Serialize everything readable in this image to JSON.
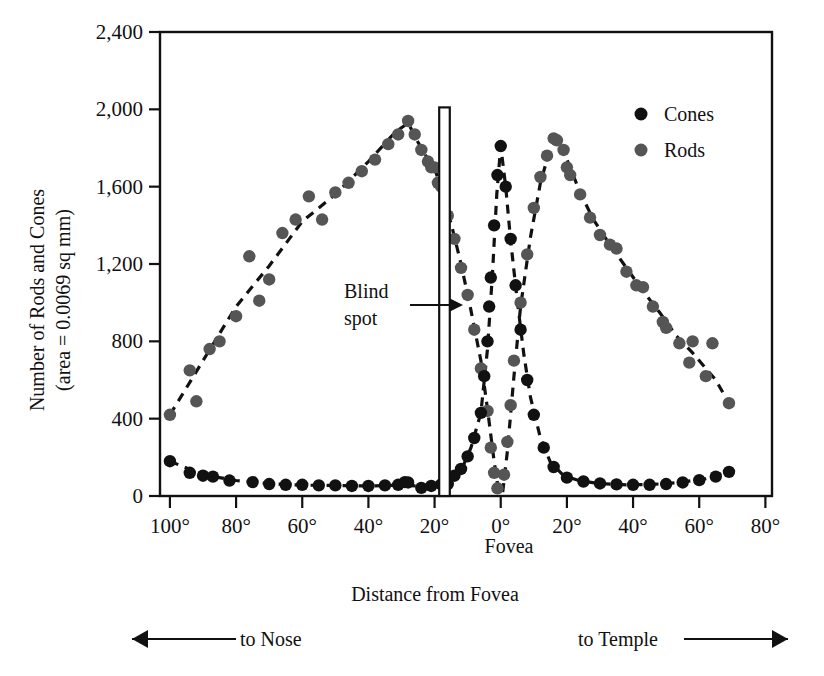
{
  "chart_data": {
    "type": "scatter",
    "title": "",
    "xlabel": "Distance from Fovea",
    "ylabel": "Number of Rods and Cones (area = 0.0069 sq mm)",
    "ylabel_line1": "Number of Rods and Cones",
    "ylabel_line2": "(area = 0.0069 sq mm)",
    "xlim": [
      -103,
      82
    ],
    "ylim": [
      0,
      2400
    ],
    "grid": false,
    "legend_position": "top-right",
    "x_ticks": [
      -100,
      -80,
      -60,
      -40,
      -20,
      0,
      20,
      40,
      60,
      80
    ],
    "x_tick_labels": [
      "100°",
      "80°",
      "60°",
      "40°",
      "20°",
      "0°",
      "20°",
      "40°",
      "60°",
      "80°"
    ],
    "y_ticks": [
      0,
      400,
      800,
      1200,
      1600,
      2000,
      2400
    ],
    "y_tick_labels": [
      "0",
      "400",
      "800",
      "1,200",
      "1,600",
      "2,000",
      "2,400"
    ],
    "fovea_label": "Fovea",
    "annotations": [
      {
        "name": "blind-spot",
        "text_line1": "Blind",
        "text_line2": "spot",
        "x_center": -17.0,
        "x_half_width": 1.6,
        "y_top": 2010
      },
      {
        "name": "to-nose",
        "text": "to Nose",
        "direction": "left"
      },
      {
        "name": "to-temple",
        "text": "to Temple",
        "direction": "right"
      }
    ],
    "series": [
      {
        "name": "Cones",
        "color": "#111111",
        "marker": "circle",
        "points": [
          [
            -100,
            180
          ],
          [
            -94,
            120
          ],
          [
            -90,
            105
          ],
          [
            -87,
            100
          ],
          [
            -82,
            80
          ],
          [
            -75,
            72
          ],
          [
            -70,
            62
          ],
          [
            -65,
            58
          ],
          [
            -60,
            58
          ],
          [
            -55,
            55
          ],
          [
            -50,
            55
          ],
          [
            -45,
            52
          ],
          [
            -40,
            52
          ],
          [
            -35,
            55
          ],
          [
            -31,
            58
          ],
          [
            -29,
            72
          ],
          [
            -28,
            70
          ],
          [
            -24,
            42
          ],
          [
            -21,
            52
          ],
          [
            -18,
            60
          ],
          [
            -16,
            62
          ],
          [
            -14,
            105
          ],
          [
            -12,
            140
          ],
          [
            -10,
            205
          ],
          [
            -8,
            300
          ],
          [
            -6,
            430
          ],
          [
            -5,
            620
          ],
          [
            -4,
            800
          ],
          [
            -3.5,
            980
          ],
          [
            -3,
            1130
          ],
          [
            -2,
            1400
          ],
          [
            -1,
            1660
          ],
          [
            0,
            1810
          ],
          [
            1.5,
            1600
          ],
          [
            3,
            1330
          ],
          [
            4.5,
            1090
          ],
          [
            6,
            860
          ],
          [
            8,
            600
          ],
          [
            10,
            420
          ],
          [
            13,
            250
          ],
          [
            16,
            150
          ],
          [
            20,
            95
          ],
          [
            25,
            75
          ],
          [
            30,
            65
          ],
          [
            35,
            60
          ],
          [
            40,
            58
          ],
          [
            45,
            58
          ],
          [
            50,
            62
          ],
          [
            55,
            70
          ],
          [
            60,
            82
          ],
          [
            65,
            100
          ],
          [
            69,
            125
          ]
        ]
      },
      {
        "name": "Rods",
        "color": "#555555",
        "marker": "circle",
        "points": [
          [
            -100,
            420
          ],
          [
            -94,
            650
          ],
          [
            -92,
            490
          ],
          [
            -88,
            760
          ],
          [
            -85,
            800
          ],
          [
            -80,
            930
          ],
          [
            -76,
            1240
          ],
          [
            -73,
            1010
          ],
          [
            -70,
            1120
          ],
          [
            -66,
            1360
          ],
          [
            -62,
            1430
          ],
          [
            -58,
            1550
          ],
          [
            -54,
            1430
          ],
          [
            -50,
            1570
          ],
          [
            -46,
            1620
          ],
          [
            -42,
            1680
          ],
          [
            -38,
            1740
          ],
          [
            -34,
            1820
          ],
          [
            -31,
            1870
          ],
          [
            -28,
            1940
          ],
          [
            -26,
            1870
          ],
          [
            -24,
            1790
          ],
          [
            -22,
            1730
          ],
          [
            -21,
            1700
          ],
          [
            -20,
            1700
          ],
          [
            -19,
            1620
          ],
          [
            -18,
            1600
          ],
          [
            -16,
            1450
          ],
          [
            -14,
            1330
          ],
          [
            -12,
            1180
          ],
          [
            -10,
            1040
          ],
          [
            -8,
            860
          ],
          [
            -6,
            660
          ],
          [
            -4,
            440
          ],
          [
            -3,
            250
          ],
          [
            -2,
            120
          ],
          [
            -1,
            40
          ],
          [
            1,
            110
          ],
          [
            2,
            280
          ],
          [
            3,
            470
          ],
          [
            4,
            700
          ],
          [
            6,
            1000
          ],
          [
            8,
            1250
          ],
          [
            10,
            1490
          ],
          [
            12,
            1650
          ],
          [
            14,
            1760
          ],
          [
            16,
            1850
          ],
          [
            17,
            1840
          ],
          [
            19,
            1790
          ],
          [
            20,
            1700
          ],
          [
            21,
            1660
          ],
          [
            24,
            1560
          ],
          [
            27,
            1440
          ],
          [
            30,
            1350
          ],
          [
            33,
            1300
          ],
          [
            35,
            1280
          ],
          [
            38,
            1160
          ],
          [
            41,
            1090
          ],
          [
            43,
            1080
          ],
          [
            46,
            980
          ],
          [
            49,
            900
          ],
          [
            50,
            870
          ],
          [
            54,
            790
          ],
          [
            57,
            690
          ],
          [
            58,
            800
          ],
          [
            62,
            620
          ],
          [
            64,
            790
          ],
          [
            69,
            480
          ]
        ]
      }
    ],
    "fit_curves": [
      {
        "name": "rods-nasal-fit",
        "series": "Rods",
        "points": [
          [
            -100,
            420
          ],
          [
            -90,
            700
          ],
          [
            -80,
            980
          ],
          [
            -70,
            1190
          ],
          [
            -60,
            1420
          ],
          [
            -50,
            1560
          ],
          [
            -40,
            1730
          ],
          [
            -32,
            1880
          ],
          [
            -28,
            1930
          ],
          [
            -25,
            1830
          ],
          [
            -22,
            1740
          ],
          [
            -20,
            1700
          ],
          [
            -18,
            1580
          ],
          [
            -15,
            1410
          ],
          [
            -12,
            1200
          ],
          [
            -9,
            960
          ],
          [
            -6,
            700
          ],
          [
            -4,
            450
          ],
          [
            -2,
            180
          ],
          [
            -0.6,
            20
          ]
        ]
      },
      {
        "name": "rods-temporal-fit",
        "series": "Rods",
        "points": [
          [
            0.6,
            20
          ],
          [
            2,
            230
          ],
          [
            4,
            620
          ],
          [
            6,
            980
          ],
          [
            9,
            1340
          ],
          [
            12,
            1620
          ],
          [
            15,
            1800
          ],
          [
            17,
            1850
          ],
          [
            20,
            1740
          ],
          [
            24,
            1570
          ],
          [
            28,
            1430
          ],
          [
            33,
            1300
          ],
          [
            38,
            1180
          ],
          [
            43,
            1060
          ],
          [
            48,
            950
          ],
          [
            53,
            830
          ],
          [
            58,
            740
          ],
          [
            62,
            660
          ],
          [
            65,
            600
          ],
          [
            69,
            480
          ]
        ]
      },
      {
        "name": "cones-fit",
        "series": "Cones",
        "points": [
          [
            -100,
            180
          ],
          [
            -90,
            110
          ],
          [
            -80,
            80
          ],
          [
            -70,
            64
          ],
          [
            -60,
            56
          ],
          [
            -50,
            54
          ],
          [
            -40,
            52
          ],
          [
            -30,
            56
          ],
          [
            -22,
            50
          ],
          [
            -16,
            62
          ],
          [
            -12,
            130
          ],
          [
            -9,
            250
          ],
          [
            -6,
            430
          ],
          [
            -4,
            760
          ],
          [
            -2.5,
            1150
          ],
          [
            -1.2,
            1560
          ],
          [
            0,
            1810
          ],
          [
            1.5,
            1600
          ],
          [
            3,
            1320
          ],
          [
            5,
            1010
          ],
          [
            7,
            730
          ],
          [
            9,
            510
          ],
          [
            12,
            300
          ],
          [
            15,
            175
          ],
          [
            19,
            105
          ],
          [
            24,
            78
          ],
          [
            30,
            64
          ],
          [
            38,
            58
          ],
          [
            46,
            60
          ],
          [
            54,
            70
          ],
          [
            62,
            90
          ],
          [
            69,
            125
          ]
        ]
      }
    ],
    "legend": [
      {
        "label": "Cones",
        "color": "#111111"
      },
      {
        "label": "Rods",
        "color": "#555555"
      }
    ]
  }
}
